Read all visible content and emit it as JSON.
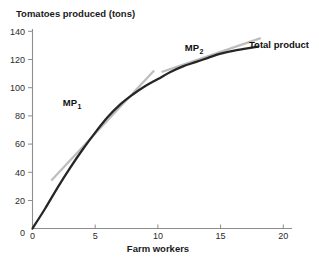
{
  "chart_data": {
    "type": "line",
    "title": "Tomatoes produced (tons)",
    "xlabel": "Farm workers",
    "ylabel": "Tomatoes produced (tons)",
    "xlim": [
      0,
      21
    ],
    "ylim": [
      0,
      145
    ],
    "grid": false,
    "legend_position": "inline-annotations",
    "xticks": [
      "0",
      "5",
      "10",
      "15",
      "20"
    ],
    "xtick_values": [
      0,
      5,
      10,
      15,
      20
    ],
    "yticks": [
      "0",
      "20",
      "40",
      "60",
      "80",
      "100",
      "120",
      "140"
    ],
    "ytick_values": [
      0,
      20,
      40,
      60,
      80,
      100,
      120,
      140
    ],
    "series": [
      {
        "name": "Total product",
        "color": "#262626",
        "label": "Total product",
        "x": [
          0,
          1,
          2,
          3,
          4,
          5,
          6,
          7,
          8,
          9,
          10,
          11,
          12,
          13,
          14,
          15,
          16,
          17,
          18
        ],
        "values": [
          0,
          14,
          29,
          43,
          56,
          68,
          79,
          88,
          95,
          101,
          106,
          111,
          115,
          118,
          121,
          124,
          126,
          127.5,
          129
        ]
      },
      {
        "name": "MP1 tangent",
        "color": "#bdbdbd",
        "label": "MP",
        "sublabel": "1",
        "x": [
          1.5,
          9.7
        ],
        "values": [
          34,
          112
        ]
      },
      {
        "name": "MP2 tangent",
        "color": "#bdbdbd",
        "label": "MP",
        "sublabel": "2",
        "x": [
          10.3,
          18.2
        ],
        "values": [
          111,
          135
        ]
      }
    ],
    "annotations": [
      {
        "text": "MP",
        "sub": "1",
        "x": 5.6,
        "y": 85
      },
      {
        "text": "MP",
        "sub": "2",
        "x": 12.3,
        "y": 127
      },
      {
        "text": "Total product",
        "x": 18.6,
        "y": 131
      }
    ]
  }
}
